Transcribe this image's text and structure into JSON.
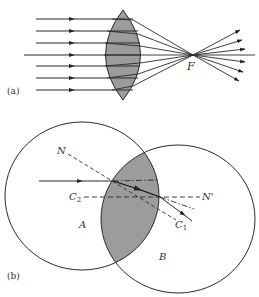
{
  "figure": {
    "panel_a": {
      "label": "(a)",
      "focal_label": "F",
      "description": "Converging (biconvex) lens focusing parallel rays to focal point F"
    },
    "panel_b": {
      "label": "(b)",
      "region_a_label": "A",
      "region_b_label": "B",
      "center_1_label": "C",
      "center_1_sub": "1",
      "center_2_label": "C",
      "center_2_sub": "2",
      "normal_label": "N",
      "normal_prime_label": "N'",
      "description": "Lens formed by intersection of two spheres A and B with centers C1 and C2; ray refraction with normals"
    },
    "colors": {
      "lens_fill": "#9c9c9c",
      "line": "#2a2a2a",
      "background": "#ffffff"
    }
  }
}
